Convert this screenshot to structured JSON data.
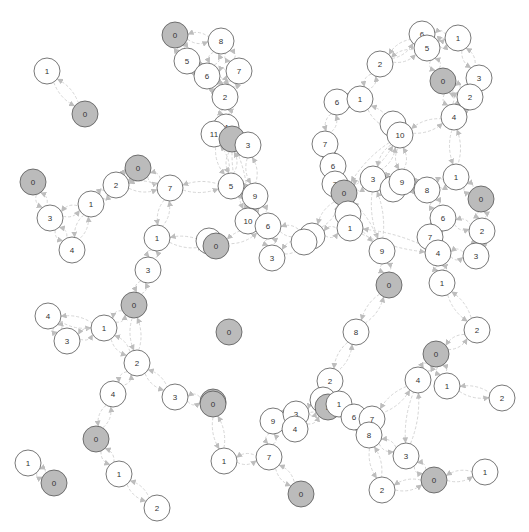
{
  "graph": {
    "type": "network",
    "node_radius": 13,
    "colors": {
      "background": "#ffffff",
      "node_fill": "#ffffff",
      "root_fill": "#bbbbbb",
      "node_stroke": "#555555",
      "edge": "#d6d6d6",
      "arrow": "#bdbdbd",
      "label": "#333333"
    },
    "nodes": [
      {
        "id": "a1",
        "label": "1",
        "x": 47,
        "y": 71,
        "root": false
      },
      {
        "id": "a0",
        "label": "0",
        "x": 85,
        "y": 114,
        "root": true
      },
      {
        "id": "b0",
        "label": "0",
        "x": 175,
        "y": 35,
        "root": true
      },
      {
        "id": "b8",
        "label": "8",
        "x": 221,
        "y": 41,
        "root": false
      },
      {
        "id": "b5",
        "label": "5",
        "x": 187,
        "y": 61,
        "root": false
      },
      {
        "id": "b6",
        "label": "6",
        "x": 207,
        "y": 76,
        "root": false
      },
      {
        "id": "b7",
        "label": "7",
        "x": 239,
        "y": 71,
        "root": false
      },
      {
        "id": "b2",
        "label": "2",
        "x": 225,
        "y": 97,
        "root": false
      },
      {
        "id": "b4",
        "label": "4",
        "x": 226,
        "y": 127,
        "root": false
      },
      {
        "id": "b11",
        "label": "11",
        "x": 214,
        "y": 134,
        "root": false
      },
      {
        "id": "bR",
        "label": "",
        "x": 232,
        "y": 139,
        "root": true
      },
      {
        "id": "b3",
        "label": "3",
        "x": 248,
        "y": 145,
        "root": false
      },
      {
        "id": "c0",
        "label": "0",
        "x": 33,
        "y": 182,
        "root": true
      },
      {
        "id": "c3",
        "label": "3",
        "x": 50,
        "y": 218,
        "root": false
      },
      {
        "id": "c4",
        "label": "4",
        "x": 72,
        "y": 250,
        "root": false
      },
      {
        "id": "c1",
        "label": "1",
        "x": 91,
        "y": 204,
        "root": false
      },
      {
        "id": "c2",
        "label": "2",
        "x": 116,
        "y": 185,
        "root": false
      },
      {
        "id": "c0b",
        "label": "0",
        "x": 138,
        "y": 168,
        "root": true
      },
      {
        "id": "c7",
        "label": "7",
        "x": 170,
        "y": 188,
        "root": false
      },
      {
        "id": "c1b",
        "label": "1",
        "x": 157,
        "y": 238,
        "root": false
      },
      {
        "id": "c3b",
        "label": "3",
        "x": 148,
        "y": 270,
        "root": false
      },
      {
        "id": "d5",
        "label": "5",
        "x": 231,
        "y": 186,
        "root": false
      },
      {
        "id": "d9",
        "label": "9",
        "x": 255,
        "y": 196,
        "root": false
      },
      {
        "id": "d10",
        "label": "10",
        "x": 248,
        "y": 221,
        "root": false
      },
      {
        "id": "d6",
        "label": "6",
        "x": 268,
        "y": 226,
        "root": false
      },
      {
        "id": "d0w",
        "label": "",
        "x": 209,
        "y": 241,
        "root": false
      },
      {
        "id": "d0",
        "label": "0",
        "x": 216,
        "y": 246,
        "root": true
      },
      {
        "id": "d3",
        "label": "3",
        "x": 272,
        "y": 258,
        "root": false
      },
      {
        "id": "d8",
        "label": "8",
        "x": 312,
        "y": 236,
        "root": false
      },
      {
        "id": "d8w",
        "label": "",
        "x": 304,
        "y": 242,
        "root": false
      },
      {
        "id": "e2",
        "label": "2",
        "x": 380,
        "y": 64,
        "root": false
      },
      {
        "id": "e6",
        "label": "6",
        "x": 422,
        "y": 34,
        "root": false
      },
      {
        "id": "e5",
        "label": "5",
        "x": 427,
        "y": 48,
        "root": false
      },
      {
        "id": "e1",
        "label": "1",
        "x": 458,
        "y": 38,
        "root": false
      },
      {
        "id": "e0",
        "label": "0",
        "x": 443,
        "y": 81,
        "root": true
      },
      {
        "id": "e3",
        "label": "3",
        "x": 479,
        "y": 78,
        "root": false
      },
      {
        "id": "e2b",
        "label": "2",
        "x": 470,
        "y": 97,
        "root": false
      },
      {
        "id": "e4",
        "label": "4",
        "x": 454,
        "y": 117,
        "root": false
      },
      {
        "id": "e6b",
        "label": "6",
        "x": 337,
        "y": 102,
        "root": false
      },
      {
        "id": "e1b",
        "label": "1",
        "x": 360,
        "y": 99,
        "root": false
      },
      {
        "id": "e7",
        "label": "7",
        "x": 325,
        "y": 144,
        "root": false
      },
      {
        "id": "e10w",
        "label": "",
        "x": 393,
        "y": 124,
        "root": false
      },
      {
        "id": "e10",
        "label": "10",
        "x": 400,
        "y": 135,
        "root": false
      },
      {
        "id": "f6",
        "label": "6",
        "x": 333,
        "y": 166,
        "root": false
      },
      {
        "id": "f7",
        "label": "7",
        "x": 335,
        "y": 184,
        "root": false
      },
      {
        "id": "f0",
        "label": "0",
        "x": 344,
        "y": 193,
        "root": true
      },
      {
        "id": "f3",
        "label": "3",
        "x": 373,
        "y": 179,
        "root": false
      },
      {
        "id": "f9w",
        "label": "",
        "x": 393,
        "y": 189,
        "root": false
      },
      {
        "id": "f9",
        "label": "9",
        "x": 402,
        "y": 182,
        "root": false
      },
      {
        "id": "f8",
        "label": "8",
        "x": 427,
        "y": 190,
        "root": false
      },
      {
        "id": "f1",
        "label": "1",
        "x": 456,
        "y": 177,
        "root": false
      },
      {
        "id": "f0b",
        "label": "0",
        "x": 481,
        "y": 199,
        "root": true
      },
      {
        "id": "f6b",
        "label": "6",
        "x": 443,
        "y": 218,
        "root": false
      },
      {
        "id": "f2",
        "label": "2",
        "x": 482,
        "y": 231,
        "root": false
      },
      {
        "id": "f7b",
        "label": "7",
        "x": 430,
        "y": 237,
        "root": false
      },
      {
        "id": "f4",
        "label": "4",
        "x": 438,
        "y": 253,
        "root": false
      },
      {
        "id": "f3b",
        "label": "3",
        "x": 476,
        "y": 256,
        "root": false
      },
      {
        "id": "f1b",
        "label": "1",
        "x": 442,
        "y": 283,
        "root": false
      },
      {
        "id": "fw",
        "label": "",
        "x": 348,
        "y": 214,
        "root": false
      },
      {
        "id": "f1c",
        "label": "1",
        "x": 350,
        "y": 228,
        "root": false
      },
      {
        "id": "f9b",
        "label": "9",
        "x": 382,
        "y": 251,
        "root": false
      },
      {
        "id": "f0c",
        "label": "0",
        "x": 389,
        "y": 285,
        "root": true
      },
      {
        "id": "g8",
        "label": "8",
        "x": 356,
        "y": 332,
        "root": false
      },
      {
        "id": "g2",
        "label": "2",
        "x": 477,
        "y": 330,
        "root": false
      },
      {
        "id": "g0",
        "label": "0",
        "x": 436,
        "y": 354,
        "root": true
      },
      {
        "id": "g4",
        "label": "4",
        "x": 418,
        "y": 380,
        "root": false
      },
      {
        "id": "g1",
        "label": "1",
        "x": 447,
        "y": 386,
        "root": false
      },
      {
        "id": "g2b",
        "label": "2",
        "x": 502,
        "y": 398,
        "root": false
      },
      {
        "id": "h4",
        "label": "4",
        "x": 48,
        "y": 316,
        "root": false
      },
      {
        "id": "h3",
        "label": "3",
        "x": 67,
        "y": 341,
        "root": false
      },
      {
        "id": "h1",
        "label": "1",
        "x": 104,
        "y": 328,
        "root": false
      },
      {
        "id": "h0",
        "label": "0",
        "x": 134,
        "y": 305,
        "root": true
      },
      {
        "id": "h2",
        "label": "2",
        "x": 137,
        "y": 363,
        "root": false
      },
      {
        "id": "h4b",
        "label": "4",
        "x": 113,
        "y": 394,
        "root": false
      },
      {
        "id": "h3b",
        "label": "3",
        "x": 175,
        "y": 397,
        "root": false
      },
      {
        "id": "h0b",
        "label": "0",
        "x": 213,
        "y": 402,
        "root": true
      },
      {
        "id": "hI",
        "label": "0",
        "x": 229,
        "y": 332,
        "root": true
      },
      {
        "id": "i0",
        "label": "0",
        "x": 96,
        "y": 439,
        "root": true
      },
      {
        "id": "i1",
        "label": "1",
        "x": 119,
        "y": 474,
        "root": false
      },
      {
        "id": "i2",
        "label": "2",
        "x": 157,
        "y": 508,
        "root": false
      },
      {
        "id": "i1b",
        "label": "1",
        "x": 28,
        "y": 463,
        "root": false
      },
      {
        "id": "i0b",
        "label": "0",
        "x": 54,
        "y": 483,
        "root": true
      },
      {
        "id": "j0",
        "label": "0",
        "x": 213,
        "y": 404,
        "root": true
      },
      {
        "id": "j1",
        "label": "1",
        "x": 224,
        "y": 461,
        "root": false
      },
      {
        "id": "j7",
        "label": "7",
        "x": 269,
        "y": 457,
        "root": false
      },
      {
        "id": "j0b",
        "label": "0",
        "x": 301,
        "y": 494,
        "root": true
      },
      {
        "id": "j9",
        "label": "9",
        "x": 273,
        "y": 421,
        "root": false
      },
      {
        "id": "j3",
        "label": "3",
        "x": 296,
        "y": 414,
        "root": false
      },
      {
        "id": "j4",
        "label": "4",
        "x": 295,
        "y": 429,
        "root": false
      },
      {
        "id": "j2",
        "label": "2",
        "x": 330,
        "y": 381,
        "root": false
      },
      {
        "id": "j5w",
        "label": "",
        "x": 323,
        "y": 400,
        "root": false
      },
      {
        "id": "j5",
        "label": "5",
        "x": 328,
        "y": 407,
        "root": true
      },
      {
        "id": "j1b",
        "label": "1",
        "x": 339,
        "y": 404,
        "root": false
      },
      {
        "id": "j6",
        "label": "6",
        "x": 354,
        "y": 417,
        "root": false
      },
      {
        "id": "j7b",
        "label": "7",
        "x": 372,
        "y": 419,
        "root": false
      },
      {
        "id": "j8",
        "label": "8",
        "x": 369,
        "y": 435,
        "root": false
      },
      {
        "id": "j3b",
        "label": "3",
        "x": 406,
        "y": 456,
        "root": false
      },
      {
        "id": "j2b",
        "label": "2",
        "x": 382,
        "y": 490,
        "root": false
      },
      {
        "id": "j0c",
        "label": "0",
        "x": 434,
        "y": 480,
        "root": true
      },
      {
        "id": "j1c",
        "label": "1",
        "x": 485,
        "y": 472,
        "root": false
      }
    ],
    "edges": [
      [
        "a1",
        "a0"
      ],
      [
        "b0",
        "b8"
      ],
      [
        "b0",
        "b5"
      ],
      [
        "b5",
        "b6"
      ],
      [
        "b6",
        "b8"
      ],
      [
        "b6",
        "b7"
      ],
      [
        "b7",
        "b8"
      ],
      [
        "b6",
        "b2"
      ],
      [
        "b7",
        "b2"
      ],
      [
        "b2",
        "b4"
      ],
      [
        "b4",
        "b11"
      ],
      [
        "b4",
        "bR"
      ],
      [
        "bR",
        "b3"
      ],
      [
        "b11",
        "d5"
      ],
      [
        "bR",
        "d5"
      ],
      [
        "b3",
        "d9"
      ],
      [
        "bR",
        "d10"
      ],
      [
        "c0",
        "c3"
      ],
      [
        "c3",
        "c4"
      ],
      [
        "c3",
        "c1"
      ],
      [
        "c1",
        "c4"
      ],
      [
        "c1",
        "c2"
      ],
      [
        "c2",
        "c0b"
      ],
      [
        "c0b",
        "c7"
      ],
      [
        "c2",
        "c7"
      ],
      [
        "c7",
        "c1b"
      ],
      [
        "c1b",
        "c3b"
      ],
      [
        "c1b",
        "d0"
      ],
      [
        "c3b",
        "h0"
      ],
      [
        "d5",
        "d9"
      ],
      [
        "d9",
        "d10"
      ],
      [
        "d10",
        "d6"
      ],
      [
        "d9",
        "d6"
      ],
      [
        "d6",
        "d0"
      ],
      [
        "d6",
        "d3"
      ],
      [
        "d3",
        "d8"
      ],
      [
        "d6",
        "d8"
      ],
      [
        "d8",
        "f1c"
      ],
      [
        "d8",
        "f0"
      ],
      [
        "c7",
        "d5"
      ],
      [
        "e2",
        "e6"
      ],
      [
        "e2",
        "e5"
      ],
      [
        "e6",
        "e1"
      ],
      [
        "e5",
        "e1"
      ],
      [
        "e5",
        "e0"
      ],
      [
        "e1",
        "e3"
      ],
      [
        "e0",
        "e2b"
      ],
      [
        "e3",
        "e2b"
      ],
      [
        "e2b",
        "e4"
      ],
      [
        "e0",
        "e4"
      ],
      [
        "e2",
        "e1b"
      ],
      [
        "e1b",
        "e6b"
      ],
      [
        "e6b",
        "e7"
      ],
      [
        "e1b",
        "e10"
      ],
      [
        "e10",
        "e4"
      ],
      [
        "e4",
        "f1"
      ],
      [
        "e7",
        "f6"
      ],
      [
        "e10",
        "f3"
      ],
      [
        "e10",
        "f9"
      ],
      [
        "e10",
        "f0"
      ],
      [
        "f6",
        "f7"
      ],
      [
        "f7",
        "f0"
      ],
      [
        "f0",
        "f3"
      ],
      [
        "f3",
        "f9"
      ],
      [
        "f9",
        "f8"
      ],
      [
        "f8",
        "f1"
      ],
      [
        "f1",
        "f0b"
      ],
      [
        "f0b",
        "f2"
      ],
      [
        "f8",
        "f6b"
      ],
      [
        "f6b",
        "f7b"
      ],
      [
        "f7b",
        "f4"
      ],
      [
        "f4",
        "f3b"
      ],
      [
        "f2",
        "f3b"
      ],
      [
        "f6b",
        "f2"
      ],
      [
        "f4",
        "f1b"
      ],
      [
        "f0",
        "fw"
      ],
      [
        "fw",
        "f1c"
      ],
      [
        "f3",
        "f9b"
      ],
      [
        "f9b",
        "f0c"
      ],
      [
        "f0",
        "f9b"
      ],
      [
        "f1b",
        "g2"
      ],
      [
        "f0c",
        "g8"
      ],
      [
        "f1c",
        "f4"
      ],
      [
        "g8",
        "j2"
      ],
      [
        "g2",
        "g0"
      ],
      [
        "g0",
        "g4"
      ],
      [
        "g0",
        "g1"
      ],
      [
        "g1",
        "g2b"
      ],
      [
        "g4",
        "j7b"
      ],
      [
        "h4",
        "h3"
      ],
      [
        "h4",
        "h1"
      ],
      [
        "h3",
        "h1"
      ],
      [
        "h1",
        "h0"
      ],
      [
        "h0",
        "h2"
      ],
      [
        "h1",
        "h2"
      ],
      [
        "h2",
        "h4b"
      ],
      [
        "h2",
        "h3b"
      ],
      [
        "h3b",
        "h0b"
      ],
      [
        "h4b",
        "i0"
      ],
      [
        "i0",
        "i1"
      ],
      [
        "i1",
        "i2"
      ],
      [
        "i1b",
        "i0b"
      ],
      [
        "j0",
        "j1"
      ],
      [
        "j1",
        "j7"
      ],
      [
        "j7",
        "j0b"
      ],
      [
        "j7",
        "j9"
      ],
      [
        "j9",
        "j3"
      ],
      [
        "j3",
        "j4"
      ],
      [
        "j3",
        "j5"
      ],
      [
        "j4",
        "j5"
      ],
      [
        "j2",
        "j5"
      ],
      [
        "j5",
        "j1b"
      ],
      [
        "j1b",
        "j6"
      ],
      [
        "j6",
        "j7b"
      ],
      [
        "j7b",
        "j8"
      ],
      [
        "j6",
        "j8"
      ],
      [
        "j8",
        "j3b"
      ],
      [
        "j8",
        "j2b"
      ],
      [
        "j3b",
        "j0c"
      ],
      [
        "j2b",
        "j0c"
      ],
      [
        "j0c",
        "j1c"
      ],
      [
        "j3b",
        "g4"
      ]
    ]
  }
}
